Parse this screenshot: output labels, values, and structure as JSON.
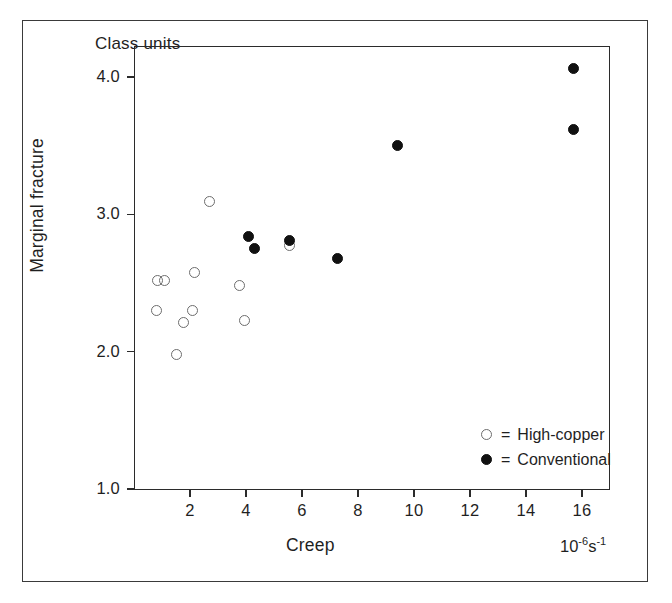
{
  "figure": {
    "top_note": "Class units",
    "y_axis_title": "Marginal fracture",
    "x_axis_title": "Creep",
    "x_axis_units_base": "10",
    "x_axis_units_exp1": "-6",
    "x_axis_units_mid": "s",
    "x_axis_units_exp2": "-1"
  },
  "legend": {
    "equals": "=",
    "items": [
      {
        "marker": "open-circle",
        "label": "High-copper"
      },
      {
        "marker": "filled-circle",
        "label": "Conventional"
      }
    ]
  },
  "chart_data": {
    "type": "scatter",
    "title": "Class units",
    "xlabel": "Creep",
    "ylabel": "Marginal fracture",
    "xunits": "10^-6 s^-1",
    "xlim": [
      0,
      17
    ],
    "ylim": [
      1.0,
      4.2
    ],
    "xticks": [
      2,
      4,
      6,
      8,
      10,
      12,
      14,
      16
    ],
    "xtick_labels": [
      "2",
      "4",
      "6",
      "8",
      "10",
      "12",
      "14",
      "16"
    ],
    "yticks": [
      1.0,
      2.0,
      3.0,
      4.0
    ],
    "ytick_labels": [
      "1.0",
      "2.0",
      "3.0",
      "4.0"
    ],
    "grid": false,
    "legend_position": "inside-lower-right",
    "series": [
      {
        "name": "High-copper",
        "marker": "open-circle",
        "color": "#6d6d6d",
        "points": [
          {
            "x": 0.85,
            "y": 2.52
          },
          {
            "x": 1.1,
            "y": 2.52
          },
          {
            "x": 0.8,
            "y": 2.3
          },
          {
            "x": 1.5,
            "y": 1.98
          },
          {
            "x": 1.75,
            "y": 2.21
          },
          {
            "x": 2.1,
            "y": 2.3
          },
          {
            "x": 2.15,
            "y": 2.58
          },
          {
            "x": 2.7,
            "y": 3.09
          },
          {
            "x": 3.75,
            "y": 2.48
          },
          {
            "x": 3.95,
            "y": 2.23
          },
          {
            "x": 5.55,
            "y": 2.77
          }
        ]
      },
      {
        "name": "Conventional",
        "marker": "filled-circle",
        "color": "#111111",
        "points": [
          {
            "x": 4.1,
            "y": 2.84
          },
          {
            "x": 4.3,
            "y": 2.75
          },
          {
            "x": 5.55,
            "y": 2.81
          },
          {
            "x": 7.25,
            "y": 2.68
          },
          {
            "x": 9.4,
            "y": 3.5
          },
          {
            "x": 15.7,
            "y": 4.06
          },
          {
            "x": 15.7,
            "y": 3.62
          }
        ]
      }
    ]
  }
}
